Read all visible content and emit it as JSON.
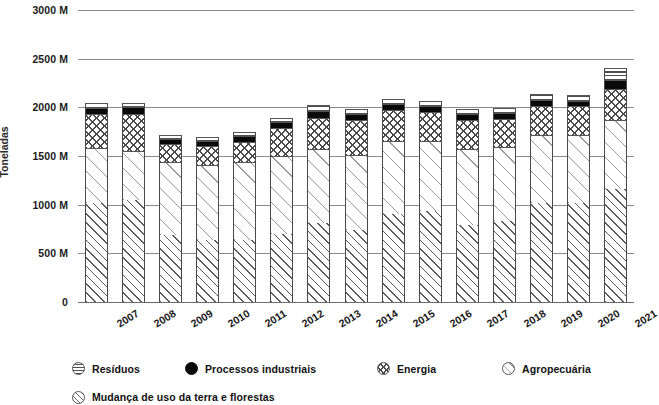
{
  "chart_data": {
    "type": "bar",
    "stacked": true,
    "title": "",
    "xlabel": "",
    "ylabel": "Toneladas",
    "ylim": [
      0,
      3000
    ],
    "yticks": [
      0,
      500,
      1000,
      1500,
      2000,
      2500,
      3000
    ],
    "ytick_labels": [
      "0",
      "500 M",
      "1000 M",
      "1500 M",
      "2000 M",
      "2500 M",
      "3000 M"
    ],
    "unit_suffix": "M",
    "grid": true,
    "legend_position": "bottom-left",
    "categories": [
      "2007",
      "2008",
      "2009",
      "2010",
      "2011",
      "2012",
      "2013",
      "2014",
      "2015",
      "2016",
      "2017",
      "2018",
      "2019",
      "2020",
      "2021"
    ],
    "series": [
      {
        "name": "Mudança de uso da terra e florestas",
        "pattern": "diagonal-hatch-dense",
        "values": [
          1020,
          1050,
          690,
          640,
          640,
          700,
          810,
          740,
          905,
          930,
          790,
          830,
          1015,
          1020,
          1160
        ]
      },
      {
        "name": "Agropecuária",
        "pattern": "diagonal-hatch-sparse",
        "values": [
          560,
          500,
          745,
          770,
          795,
          800,
          760,
          775,
          745,
          720,
          785,
          760,
          700,
          700,
          705
        ]
      },
      {
        "name": "Energia",
        "pattern": "cross-hatch",
        "values": [
          350,
          385,
          185,
          190,
          210,
          285,
          325,
          355,
          325,
          300,
          295,
          290,
          300,
          290,
          325
        ]
      },
      {
        "name": "Processos industriais",
        "pattern": "solid-black",
        "values": [
          65,
          70,
          55,
          55,
          60,
          60,
          70,
          65,
          60,
          60,
          60,
          60,
          65,
          60,
          95
        ]
      },
      {
        "name": "Resíduos",
        "pattern": "horizontal-lines",
        "values": [
          45,
          45,
          45,
          45,
          45,
          50,
          55,
          50,
          55,
          55,
          55,
          55,
          55,
          55,
          115
        ]
      }
    ],
    "totals": [
      2040,
      2050,
      1720,
      1700,
      1750,
      1895,
      2020,
      1985,
      2090,
      2065,
      1985,
      1995,
      2135,
      2125,
      2400
    ]
  },
  "axis": {
    "y_title": "Toneladas"
  },
  "legend": {
    "items": [
      {
        "label": "Resíduos",
        "marker": "circle-horizontal-lines"
      },
      {
        "label": "Processos industriais",
        "marker": "circle-solid-black"
      },
      {
        "label": "Energia",
        "marker": "circle-cross-hatch"
      },
      {
        "label": "Agropecuária",
        "marker": "circle-sparse-diagonal"
      },
      {
        "label": "Mudança de uso da terra e florestas",
        "marker": "circle-diagonal-hatch"
      }
    ]
  },
  "colors": {
    "grid": "#8b8b8b",
    "text": "#1a1a1a",
    "processos_fill": "#0a0a0a",
    "bar_outline": "#4a4a4a"
  }
}
